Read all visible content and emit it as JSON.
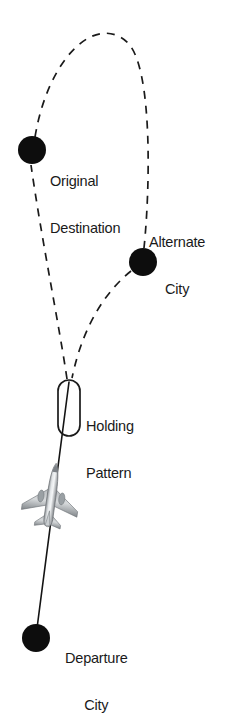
{
  "diagram": {
    "background_color": "#ffffff",
    "stroke_color": "#1a1a1a",
    "node_color": "#0d0d0d",
    "labels": {
      "original_destination": {
        "line1": "Original",
        "line2": "Destination"
      },
      "alternate_city": {
        "line1": "Alternate",
        "line2": "City"
      },
      "holding_pattern": {
        "line1": "Holding",
        "line2": "Pattern"
      },
      "departure_city": {
        "line1": "Departure",
        "line2": "City"
      }
    },
    "nodes": [
      {
        "id": "original-destination",
        "label": "Original Destination",
        "cx": 32,
        "cy": 150,
        "r": 14
      },
      {
        "id": "alternate-city",
        "label": "Alternate City",
        "cx": 143,
        "cy": 262,
        "r": 14
      },
      {
        "id": "departure-city",
        "label": "Departure City",
        "cx": 36,
        "cy": 638,
        "r": 14
      }
    ],
    "holding_pattern": {
      "x": 58,
      "y": 380,
      "width": 22,
      "height": 56,
      "radius": 11
    },
    "aircraft": {
      "cx": 52,
      "cy": 493,
      "rotation_deg": 8,
      "icon": "airplane-top-view"
    },
    "routes": [
      {
        "id": "departure-to-holding",
        "style": "solid",
        "from": "departure-city",
        "to": "holding-pattern"
      },
      {
        "id": "holding-to-original",
        "style": "dashed",
        "from": "holding-pattern",
        "to": "original-destination"
      },
      {
        "id": "original-to-apex-to-alternate",
        "style": "dashed",
        "from": "original-destination",
        "to": "alternate-city"
      },
      {
        "id": "alternate-to-holding",
        "style": "dashed",
        "from": "alternate-city",
        "to": "holding-pattern"
      }
    ]
  }
}
